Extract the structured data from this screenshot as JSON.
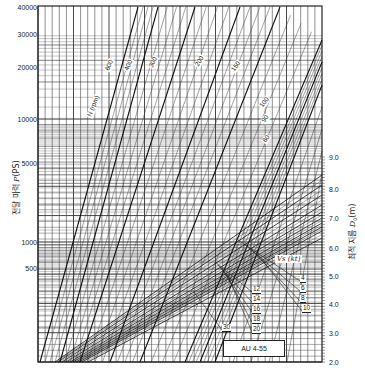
{
  "chart_data": {
    "type": "line",
    "title": "",
    "plot_id": "AU 4-55",
    "xlabel": "",
    "ylabel_left": "전달 마력 P(PS)",
    "ylabel_left_parts": {
      "korean": "전달 마력",
      "symbol": "P",
      "unit": "(PS)"
    },
    "ylabel_right": "최적 지름 D0(m)",
    "ylabel_right_parts": {
      "korean": "최적 지름",
      "symbol": "D",
      "sub": "0",
      "unit": "(m)"
    },
    "yscale_left": "log",
    "ylim_left": [
      100,
      40000
    ],
    "yticks_left": [
      {
        "label": "40000",
        "value": 40000,
        "y": 7
      },
      {
        "label": "30000",
        "value": 30000,
        "y": 34
      },
      {
        "label": "20000",
        "value": 20000,
        "y": 67
      },
      {
        "label": "10000",
        "value": 10000,
        "y": 119
      },
      {
        "label": "5000",
        "value": 5000,
        "y": 163
      },
      {
        "label": "1000",
        "value": 1000,
        "y": 242
      },
      {
        "label": "500",
        "value": 500,
        "y": 268
      }
    ],
    "ylim_right": [
      2.0,
      9.0
    ],
    "yticks_right": [
      {
        "label": "9.0",
        "value": 9.0,
        "y": 157
      },
      {
        "label": "8.0",
        "value": 8.0,
        "y": 189
      },
      {
        "label": "7.0",
        "value": 7.0,
        "y": 218
      },
      {
        "label": "6.0",
        "value": 6.0,
        "y": 248
      },
      {
        "label": "5.0",
        "value": 5.0,
        "y": 276
      },
      {
        "label": "4.0",
        "value": 4.0,
        "y": 304
      },
      {
        "label": "3.0",
        "value": 3.0,
        "y": 333
      },
      {
        "label": "2.0",
        "value": 2.0,
        "y": 362
      }
    ],
    "rpm_family": {
      "legend_title": "N (rpm)",
      "series": [
        {
          "name": "600",
          "x0": 40,
          "y0": 362,
          "x1": 138,
          "y1": 7
        },
        {
          "name": "400",
          "x0": 60,
          "y0": 362,
          "x1": 158,
          "y1": 7
        },
        {
          "name": "300",
          "x0": 80,
          "y0": 362,
          "x1": 195,
          "y1": 7
        },
        {
          "name": "200",
          "x0": 110,
          "y0": 362,
          "x1": 240,
          "y1": 7
        },
        {
          "name": "150",
          "x0": 140,
          "y0": 362,
          "x1": 280,
          "y1": 7
        },
        {
          "name": "100",
          "x0": 185,
          "y0": 362,
          "x1": 322,
          "y1": 40
        },
        {
          "name": "90",
          "x0": 200,
          "y0": 362,
          "x1": 322,
          "y1": 62
        },
        {
          "name": "80",
          "x0": 215,
          "y0": 362,
          "x1": 322,
          "y1": 85
        }
      ],
      "labels": [
        {
          "text": "N (rpm)",
          "x": 92,
          "y": 112,
          "angle": -68
        },
        {
          "text": "600",
          "x": 110,
          "y": 66,
          "angle": -68
        },
        {
          "text": "400",
          "x": 129,
          "y": 66,
          "angle": -66
        },
        {
          "text": "300",
          "x": 153,
          "y": 63,
          "angle": -62
        },
        {
          "text": "200",
          "x": 199,
          "y": 62,
          "angle": -58
        },
        {
          "text": "150",
          "x": 235,
          "y": 67,
          "angle": -55
        },
        {
          "text": "100",
          "x": 263,
          "y": 103,
          "angle": -52
        },
        {
          "text": "90",
          "x": 265,
          "y": 118,
          "angle": -52
        },
        {
          "text": "80",
          "x": 266,
          "y": 138,
          "angle": -52
        }
      ]
    },
    "diameter_family": {
      "legend_title": "Vs (kt)",
      "series": [
        {
          "name": "4",
          "x0": 55,
          "y0": 362,
          "x1": 322,
          "y1": 175
        },
        {
          "name": "6",
          "x0": 58,
          "y0": 362,
          "x1": 322,
          "y1": 185
        },
        {
          "name": "8",
          "x0": 62,
          "y0": 362,
          "x1": 322,
          "y1": 195
        },
        {
          "name": "10",
          "x0": 66,
          "y0": 362,
          "x1": 322,
          "y1": 205
        },
        {
          "name": "12",
          "x0": 70,
          "y0": 362,
          "x1": 322,
          "y1": 212
        },
        {
          "name": "14",
          "x0": 73,
          "y0": 362,
          "x1": 322,
          "y1": 218
        },
        {
          "name": "16",
          "x0": 76,
          "y0": 362,
          "x1": 322,
          "y1": 223
        },
        {
          "name": "18",
          "x0": 79,
          "y0": 362,
          "x1": 322,
          "y1": 227
        },
        {
          "name": "20",
          "x0": 82,
          "y0": 362,
          "x1": 322,
          "y1": 231
        },
        {
          "name": "30",
          "x0": 88,
          "y0": 362,
          "x1": 322,
          "y1": 238
        }
      ],
      "labels_right": [
        "4",
        "6",
        "8",
        "10"
      ],
      "labels_left": [
        "12",
        "14",
        "16",
        "18",
        "20"
      ],
      "label_far": "30"
    },
    "grid": true,
    "legend_position": "inline-labels"
  }
}
